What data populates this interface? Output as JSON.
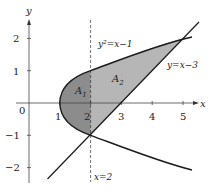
{
  "diagram": {
    "axes": {
      "x_label": "x",
      "y_label": "y",
      "origin_label": "0"
    },
    "x_ticks": [
      "1",
      "2",
      "3",
      "4",
      "5"
    ],
    "y_ticks": [
      "2",
      "1",
      "−1",
      "−2"
    ],
    "curves": {
      "parabola_label": "y²=x−1",
      "line_label": "y=x−3",
      "vertical_label": "x=2"
    },
    "regions": {
      "a1": "A",
      "a1_sub": "1",
      "a2": "A",
      "a2_sub": "2"
    },
    "colors": {
      "region_a1": "#8a8a8a",
      "region_a2": "#b4b4b4",
      "curve": "#1a1a1a"
    }
  }
}
